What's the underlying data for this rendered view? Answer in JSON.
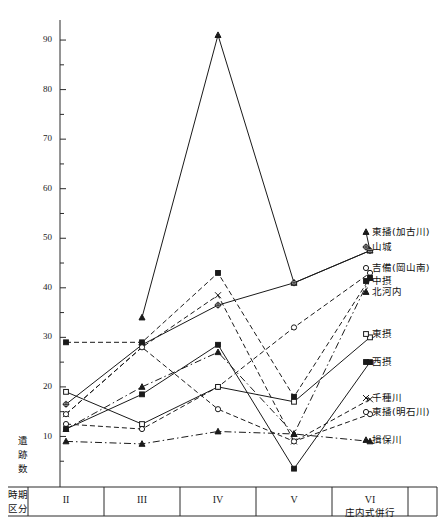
{
  "figure": {
    "y_axis_title": "遺跡数",
    "corner_label_line1": "時期",
    "corner_label_line2": "区分",
    "note_under_vi": "庄内式併行"
  },
  "chart_data": {
    "type": "line",
    "title": "",
    "xlabel": "時期区分",
    "ylabel": "遺跡数",
    "categories": [
      "II",
      "III",
      "IV",
      "V",
      "VI"
    ],
    "ylim": [
      0,
      95
    ],
    "ytick_labels": [
      "10",
      "20",
      "30",
      "40",
      "50",
      "60",
      "70",
      "80",
      "90"
    ],
    "ytick_values": [
      10,
      20,
      30,
      40,
      50,
      60,
      70,
      80,
      90
    ],
    "minor_tick_step": 5,
    "grid": false,
    "legend_position": "right",
    "series": [
      {
        "name": "東播(加古川)",
        "marker": "triangle-filled",
        "dash": "solid",
        "values": [
          null,
          34,
          91,
          41,
          47.5
        ],
        "label_y": 232
      },
      {
        "name": "山城",
        "marker": "star-open",
        "dash": "solid",
        "values": [
          16.5,
          28.5,
          36.5,
          41,
          47.5
        ],
        "label_y": 247
      },
      {
        "name": "吉備(岡山南)",
        "marker": "circle-open",
        "dash": "dashed",
        "values": [
          12.5,
          11.5,
          20,
          32,
          43
        ],
        "label_y": 268
      },
      {
        "name": "中摂",
        "marker": "square-filled",
        "dash": "dashed",
        "values": [
          29,
          29,
          43,
          18,
          42
        ],
        "label_y": 281
      },
      {
        "name": "北河内",
        "marker": "triangle-filled",
        "dash": "dashdot",
        "values": [
          11.5,
          20,
          27,
          10.5,
          42
        ],
        "label_y": 292
      },
      {
        "name": "東摂",
        "marker": "square-open",
        "dash": "solid",
        "values": [
          19,
          12.5,
          20,
          17,
          30
        ],
        "label_y": 334
      },
      {
        "name": "西摂",
        "marker": "square-filled",
        "dash": "solid",
        "values": [
          11.5,
          18.5,
          28.5,
          3.5,
          25
        ],
        "label_y": 362
      },
      {
        "name": "千種川",
        "marker": "x-mark",
        "dash": "dashed",
        "values": [
          14.5,
          28,
          38.5,
          9,
          17.5
        ],
        "label_y": 398
      },
      {
        "name": "東播(明石川)",
        "marker": "circle-open",
        "dash": "dashed",
        "values": [
          14.5,
          28,
          15.5,
          9,
          14.5
        ],
        "label_y": 412
      },
      {
        "name": "揖保川",
        "marker": "triangle-filled",
        "dash": "dashdot",
        "values": [
          9,
          8.5,
          11,
          10.5,
          9
        ],
        "label_y": 440
      }
    ]
  }
}
